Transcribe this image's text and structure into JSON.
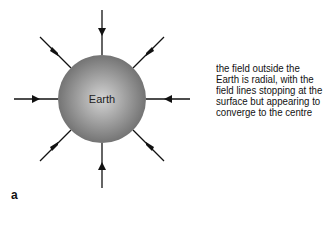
{
  "diagram": {
    "sphere_label": "Earth",
    "caption_lines": [
      "the field outside the",
      "Earth is radial, with the",
      "field lines stopping at the",
      "surface but appearing to",
      "converge to the centre"
    ],
    "panel_label": "a",
    "colors": {
      "sphere_center": "#d4d4d4",
      "sphere_edge": "#6a6a6a",
      "lines": "#111111"
    },
    "field_lines": 8
  }
}
